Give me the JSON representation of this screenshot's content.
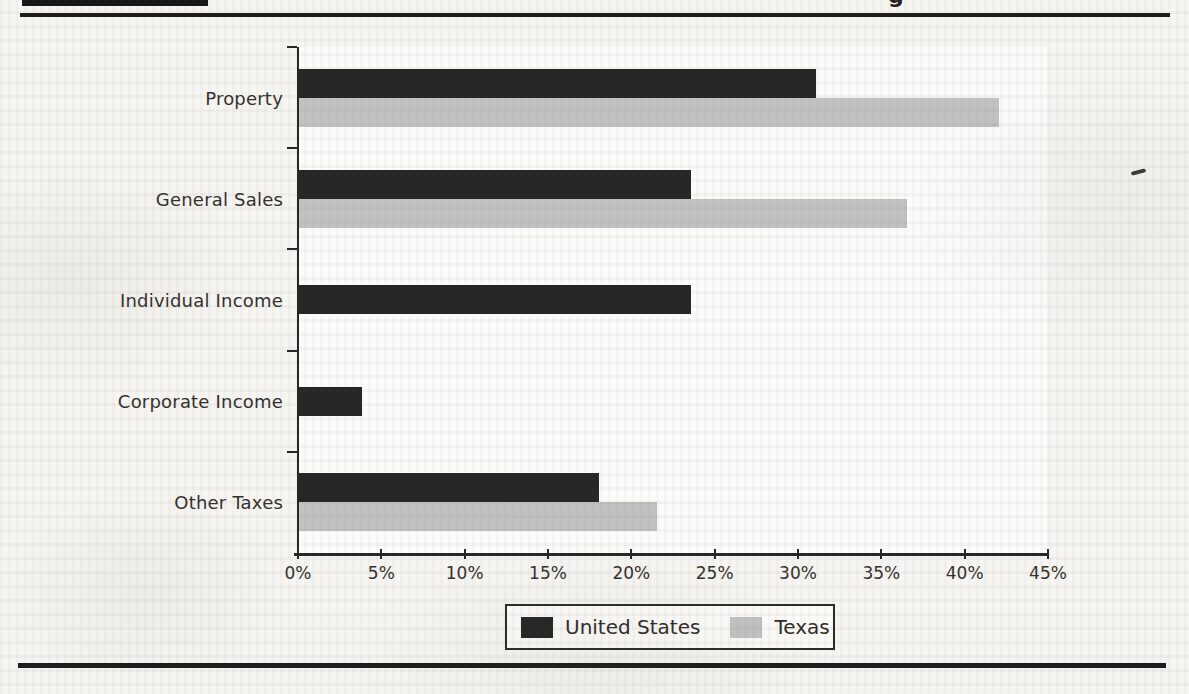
{
  "page": {
    "heading_fragment": "g"
  },
  "chart_data": {
    "type": "bar",
    "orientation": "horizontal",
    "title": "",
    "xlabel": "",
    "ylabel": "",
    "categories": [
      "Property",
      "General Sales",
      "Individual Income",
      "Corporate Income",
      "Other Taxes"
    ],
    "series": [
      {
        "name": "United States",
        "color": "#262626",
        "values": [
          31,
          23.5,
          23.5,
          3.8,
          18
        ]
      },
      {
        "name": "Texas",
        "color": "#c2c2c2",
        "values": [
          42,
          36.5,
          0,
          0,
          21.5
        ]
      }
    ],
    "xlim": [
      0,
      45
    ],
    "x_tick_labels": [
      "0%",
      "5%",
      "10%",
      "15%",
      "20%",
      "25%",
      "30%",
      "35%",
      "40%",
      "45%"
    ],
    "grid": false,
    "legend_position": "bottom"
  }
}
